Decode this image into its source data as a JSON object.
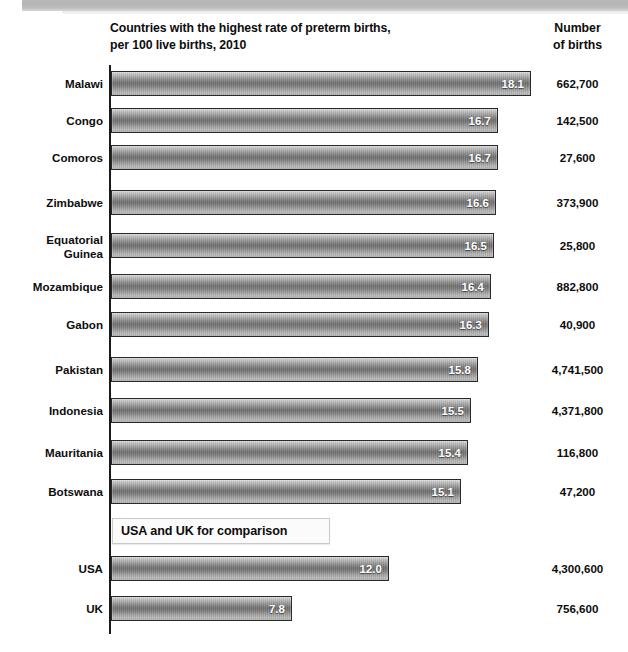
{
  "header": {
    "title": "Countries with the highest rate of preterm births,\nper 100 live births, 2010",
    "births_column_header": "Number\nof births"
  },
  "callout": {
    "label": "USA and UK for comparison"
  },
  "chart_data": {
    "type": "bar",
    "orientation": "horizontal",
    "title": "Countries with the highest rate of preterm births, per 100 live births, 2010",
    "xlabel": "Preterm births per 100 live births",
    "ylabel": "",
    "xlim": [
      0,
      18.1
    ],
    "grid": false,
    "legend": null,
    "value_format": "one-decimal",
    "categories": [
      "Malawi",
      "Congo",
      "Comoros",
      "Zimbabwe",
      "Equatorial Guinea",
      "Mozambique",
      "Gabon",
      "Pakistan",
      "Indonesia",
      "Mauritania",
      "Botswana",
      "USA",
      "UK"
    ],
    "values": [
      18.1,
      16.7,
      16.7,
      16.6,
      16.5,
      16.4,
      16.3,
      15.8,
      15.5,
      15.4,
      15.1,
      12.0,
      7.8
    ],
    "value_labels": [
      "18.1",
      "16.7",
      "16.7",
      "16.6",
      "16.5",
      "16.4",
      "16.3",
      "15.8",
      "15.5",
      "15.4",
      "15.1",
      "12.0",
      "7.8"
    ],
    "number_of_births": [
      "662,700",
      "142,500",
      "27,600",
      "373,900",
      "25,800",
      "882,800",
      "40,900",
      "4,741,500",
      "4,371,800",
      "116,800",
      "47,200",
      "4,300,600",
      "756,600"
    ],
    "annotations": [
      "USA and UK for comparison"
    ],
    "rows": [
      {
        "label": "Malawi",
        "value": 18.1,
        "value_label": "18.1",
        "births": "662,700",
        "top": 71
      },
      {
        "label": "Congo",
        "value": 16.7,
        "value_label": "16.7",
        "births": "142,500",
        "top": 108
      },
      {
        "label": "Comoros",
        "value": 16.7,
        "value_label": "16.7",
        "births": "27,600",
        "top": 145
      },
      {
        "label": "Zimbabwe",
        "value": 16.6,
        "value_label": "16.6",
        "births": "373,900",
        "top": 190
      },
      {
        "label": "Equatorial\nGuinea",
        "value": 16.5,
        "value_label": "16.5",
        "births": "25,800",
        "top": 233
      },
      {
        "label": "Mozambique",
        "value": 16.4,
        "value_label": "16.4",
        "births": "882,800",
        "top": 274
      },
      {
        "label": "Gabon",
        "value": 16.3,
        "value_label": "16.3",
        "births": "40,900",
        "top": 312
      },
      {
        "label": "Pakistan",
        "value": 15.8,
        "value_label": "15.8",
        "births": "4,741,500",
        "top": 357
      },
      {
        "label": "Indonesia",
        "value": 15.5,
        "value_label": "15.5",
        "births": "4,371,800",
        "top": 398
      },
      {
        "label": "Mauritania",
        "value": 15.4,
        "value_label": "15.4",
        "births": "116,800",
        "top": 440
      },
      {
        "label": "Botswana",
        "value": 15.1,
        "value_label": "15.1",
        "births": "47,200",
        "top": 479
      },
      {
        "label": "USA",
        "value": 12.0,
        "value_label": "12.0",
        "births": "4,300,600",
        "top": 556
      },
      {
        "label": "UK",
        "value": 7.8,
        "value_label": "7.8",
        "births": "756,600",
        "top": 596
      }
    ],
    "px_per_unit": 23.2,
    "axis_x_px": 111
  }
}
